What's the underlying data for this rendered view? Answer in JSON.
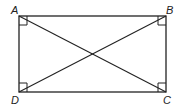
{
  "diagram": {
    "type": "rectangle-with-diagonals",
    "vertices": [
      {
        "label": "A",
        "x": 19,
        "y": 16
      },
      {
        "label": "B",
        "x": 166,
        "y": 16
      },
      {
        "label": "C",
        "x": 166,
        "y": 92
      },
      {
        "label": "D",
        "x": 19,
        "y": 92
      }
    ],
    "diagonals": [
      "AC",
      "BD"
    ],
    "right_angle_markers": [
      "A",
      "B",
      "C",
      "D"
    ],
    "colors": {
      "stroke": "#222222",
      "background": "#ffffff"
    }
  }
}
